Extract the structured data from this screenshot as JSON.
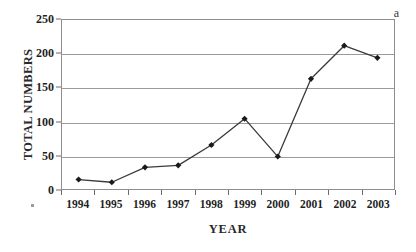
{
  "figure": {
    "annotation": "a",
    "background_color": "#ffffff",
    "line_color": "#3a3a3a",
    "marker_color": "#1a1a1a",
    "grid_color": "#9a9a9a",
    "frame_color": "#8e8e8e"
  },
  "chart_data": {
    "type": "line",
    "title": "",
    "subtitle": "",
    "xlabel": "YEAR",
    "ylabel": "TOTAL NUMBERS",
    "categories": [
      "1994",
      "1995",
      "1996",
      "1997",
      "1998",
      "1999",
      "2000",
      "2001",
      "2002",
      "2003"
    ],
    "values": [
      14,
      10,
      32,
      35,
      65,
      104,
      48,
      163,
      212,
      194
    ],
    "series": [
      {
        "name": "TOTAL NUMBERS",
        "values": [
          14,
          10,
          32,
          35,
          65,
          104,
          48,
          163,
          212,
          194
        ]
      }
    ],
    "ylim": [
      0,
      250
    ],
    "yticks": [
      0,
      50,
      100,
      150,
      200,
      250
    ],
    "ytick_labels": [
      "0",
      "50",
      "100",
      "150",
      "200",
      "250"
    ],
    "xtick_labels": [
      "1994",
      "1995",
      "1996",
      "1997",
      "1998",
      "1999",
      "2000",
      "2001",
      "2002",
      "2003"
    ],
    "grid": "horizontal",
    "legend": "none",
    "legend_position": "none",
    "markers": "diamond",
    "annotations": [
      {
        "text": "a",
        "position": "top-right"
      }
    ]
  }
}
